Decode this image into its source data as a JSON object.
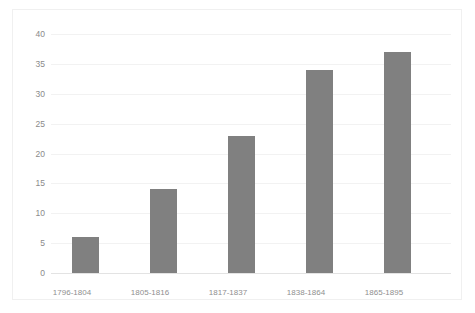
{
  "chart_data": {
    "type": "bar",
    "title": "",
    "subtitle": "",
    "xlabel": "",
    "ylabel": "",
    "categories": [
      "1796-1804",
      "1805-1816",
      "1817-1837",
      "1838-1864",
      "1865-1895"
    ],
    "values": [
      6,
      14,
      23,
      34,
      37
    ],
    "series": [
      {
        "name": "",
        "values": [
          6,
          14,
          23,
          34,
          37
        ]
      }
    ],
    "ylim": [
      0,
      40
    ],
    "yticks": [
      0,
      5,
      10,
      15,
      20,
      25,
      30,
      35,
      40
    ],
    "ytick_labels": [
      "0",
      "5",
      "10",
      "15",
      "20",
      "25",
      "30",
      "35",
      "40"
    ],
    "grid": true,
    "grid_axis": "y",
    "legend": false,
    "legend_position": "none",
    "bar_color": "#808080",
    "gridline_color": "#f2f2f2",
    "axis_text_color": "#8a8a8a",
    "background_color": "#ffffff",
    "border_color": "#f0f0f0",
    "annotations": []
  }
}
